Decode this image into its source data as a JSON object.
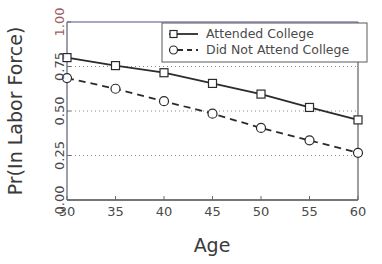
{
  "chart_data": {
    "type": "line",
    "title": "",
    "xlabel": "Age",
    "ylabel": "Pr(In Labor Force)",
    "xlim": [
      30,
      60
    ],
    "ylim": [
      0.0,
      1.0
    ],
    "xticks": [
      "30",
      "35",
      "40",
      "45",
      "50",
      "55",
      "60"
    ],
    "xtick_values": [
      30,
      35,
      40,
      45,
      50,
      55,
      60
    ],
    "yticks": [
      "0.00",
      "0.25",
      "0.50",
      "0.75",
      "1.00"
    ],
    "ytick_values": [
      0.0,
      0.25,
      0.5,
      0.75,
      1.0
    ],
    "grid": "horizontal dotted gridlines at 0.25, 0.50, 0.75",
    "gridline_values": [
      0.25,
      0.5,
      0.75
    ],
    "legend_position": "top-right",
    "x": [
      30,
      35,
      40,
      45,
      50,
      55,
      60
    ],
    "series": [
      {
        "name": "Attended College",
        "marker": "square",
        "linestyle": "solid",
        "color": "#2b2b2b",
        "values": [
          0.8,
          0.755,
          0.715,
          0.655,
          0.595,
          0.52,
          0.45
        ]
      },
      {
        "name": "Did Not Attend College",
        "marker": "circle",
        "linestyle": "dashed",
        "color": "#2b2b2b",
        "values": [
          0.685,
          0.625,
          0.555,
          0.485,
          0.405,
          0.335,
          0.265
        ]
      }
    ]
  },
  "axes": {
    "xlabel": "Age",
    "ylabel": "Pr(In Labor Force)"
  },
  "legend": {
    "entries": [
      {
        "label": "Attended College"
      },
      {
        "label": "Did Not Attend College"
      }
    ]
  },
  "colors": {
    "line": "#2b2b2b",
    "gridline": "#8a8a8a",
    "axis": "#6a6a80",
    "text": "#4a4a4a",
    "top_tick_highlight": "#9b5f66",
    "marker_fill": "#ffffff",
    "legend_border": "#5a5a5a",
    "background": "#ffffff"
  }
}
